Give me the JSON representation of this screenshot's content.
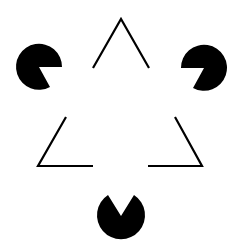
{
  "colors": {
    "background": "#ffffff",
    "ink": "#000000"
  },
  "figure": {
    "inducers": 3,
    "outline_triangle": "inverted open triangle corners",
    "illusory_triangle": "upright white triangle"
  }
}
